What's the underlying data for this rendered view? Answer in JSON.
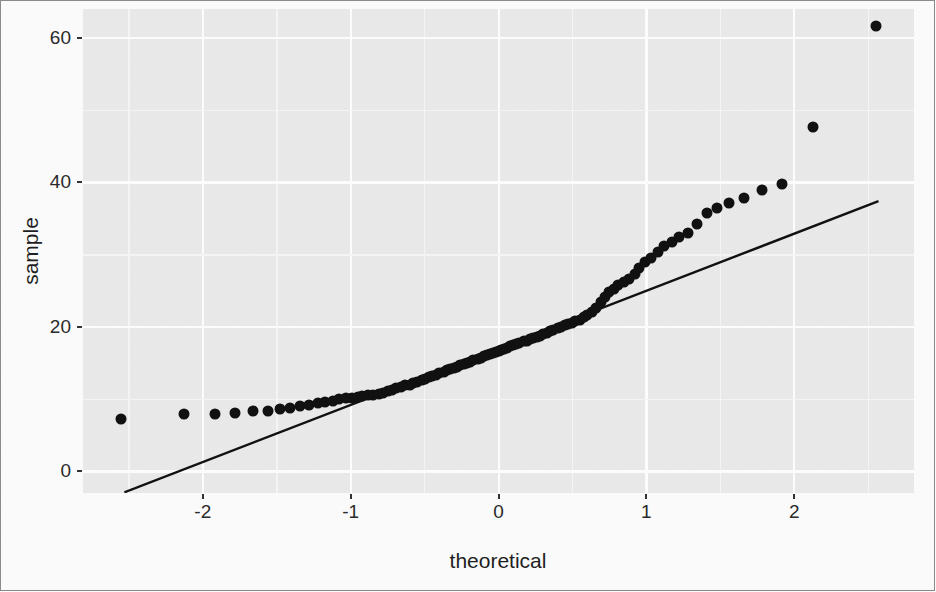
{
  "chart_data": {
    "type": "scatter",
    "title": "",
    "subtitle": "",
    "xlabel": "theoretical",
    "ylabel": "sample",
    "xlim": [
      -2.81,
      2.81
    ],
    "ylim": [
      -3.0,
      64.0
    ],
    "xticks": [
      -2,
      -1,
      0,
      1,
      2
    ],
    "xticklabels": [
      "-2",
      "-1",
      "0",
      "1",
      "2"
    ],
    "yticks": [
      0,
      20,
      40,
      60
    ],
    "yticklabels": [
      "0",
      "20",
      "40",
      "60"
    ],
    "grid": true,
    "grid_major_color": "#ffffff",
    "grid_minor_color": "#f7f7f7",
    "panel_background": "#ebebeb",
    "point_color": "#111111",
    "point_size": 11,
    "legend": "none",
    "annotations": [],
    "reference_line": {
      "name": "qq-reference-line",
      "color": "#111111",
      "x_start": -2.53,
      "y_start": -2.9,
      "x_end": 2.57,
      "y_end": 37.4
    },
    "series": [
      {
        "name": "sample quantiles",
        "x": [
          -2.55,
          -2.13,
          -1.92,
          -1.78,
          -1.66,
          -1.56,
          -1.48,
          -1.41,
          -1.34,
          -1.28,
          -1.22,
          -1.17,
          -1.12,
          -1.08,
          -1.03,
          -0.99,
          -0.95,
          -0.92,
          -0.88,
          -0.85,
          -0.81,
          -0.78,
          -0.75,
          -0.72,
          -0.69,
          -0.66,
          -0.63,
          -0.6,
          -0.58,
          -0.55,
          -0.52,
          -0.5,
          -0.47,
          -0.45,
          -0.42,
          -0.4,
          -0.37,
          -0.35,
          -0.33,
          -0.3,
          -0.28,
          -0.26,
          -0.23,
          -0.21,
          -0.19,
          -0.17,
          -0.14,
          -0.12,
          -0.1,
          -0.08,
          -0.06,
          -0.04,
          -0.02,
          0.0,
          0.02,
          0.04,
          0.06,
          0.08,
          0.1,
          0.12,
          0.14,
          0.17,
          0.19,
          0.21,
          0.23,
          0.26,
          0.28,
          0.3,
          0.33,
          0.35,
          0.37,
          0.4,
          0.42,
          0.45,
          0.47,
          0.5,
          0.52,
          0.55,
          0.58,
          0.6,
          0.63,
          0.66,
          0.69,
          0.72,
          0.75,
          0.78,
          0.81,
          0.85,
          0.88,
          0.92,
          0.95,
          0.99,
          1.03,
          1.08,
          1.12,
          1.17,
          1.22,
          1.28,
          1.34,
          1.41,
          1.48,
          1.56,
          1.66,
          1.78,
          1.92,
          2.13,
          2.55
        ],
        "y": [
          7.2,
          7.9,
          8.0,
          8.1,
          8.3,
          8.4,
          8.6,
          8.8,
          9.0,
          9.2,
          9.4,
          9.6,
          9.8,
          10.0,
          10.1,
          10.2,
          10.3,
          10.4,
          10.5,
          10.6,
          10.7,
          10.9,
          11.1,
          11.3,
          11.5,
          11.7,
          11.9,
          12.0,
          12.2,
          12.4,
          12.6,
          12.8,
          13.0,
          13.2,
          13.4,
          13.6,
          13.8,
          14.0,
          14.1,
          14.3,
          14.5,
          14.7,
          14.9,
          15.0,
          15.2,
          15.4,
          15.6,
          15.7,
          15.9,
          16.1,
          16.2,
          16.4,
          16.5,
          16.7,
          16.8,
          17.0,
          17.1,
          17.3,
          17.5,
          17.6,
          17.8,
          18.0,
          18.1,
          18.3,
          18.4,
          18.6,
          18.8,
          19.0,
          19.2,
          19.4,
          19.6,
          19.8,
          20.0,
          20.2,
          20.4,
          20.6,
          20.8,
          21.0,
          21.3,
          21.6,
          22.0,
          22.6,
          23.4,
          24.2,
          24.8,
          25.3,
          25.8,
          26.2,
          26.6,
          27.3,
          28.2,
          29.0,
          29.6,
          30.4,
          31.2,
          31.8,
          32.5,
          33.0,
          34.3,
          35.8,
          36.4,
          37.2,
          37.8,
          39.0,
          39.8,
          47.6,
          61.6
        ]
      }
    ]
  },
  "axis": {
    "x_title": "theoretical",
    "y_title": "sample"
  }
}
